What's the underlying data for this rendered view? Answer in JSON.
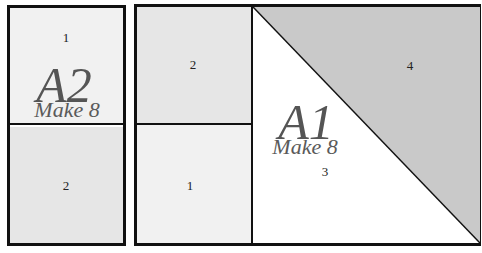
{
  "colors": {
    "border": "#111111",
    "patch_light": "#f1f1f1",
    "patch_medium": "#e6e6e6",
    "patch_white": "#ffffff",
    "triangle_gray": "#c9c9c9",
    "label_text": "#555555"
  },
  "block_a2": {
    "title": "A2",
    "subtitle": "Make 8",
    "pieces": [
      {
        "id": "1",
        "label": "1",
        "fill": "light"
      },
      {
        "id": "2",
        "label": "2",
        "fill": "medium"
      }
    ]
  },
  "block_a1": {
    "title": "A1",
    "subtitle": "Make 8",
    "pieces": [
      {
        "id": "2",
        "label": "2",
        "fill": "medium"
      },
      {
        "id": "1",
        "label": "1",
        "fill": "light"
      },
      {
        "id": "3",
        "label": "3",
        "fill": "white"
      },
      {
        "id": "4",
        "label": "4",
        "fill": "gray"
      }
    ]
  }
}
